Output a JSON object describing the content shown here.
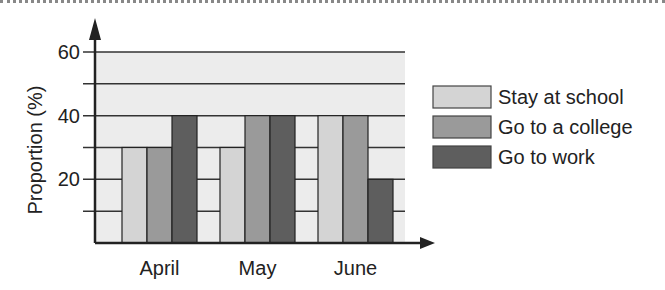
{
  "chart_data": {
    "type": "bar",
    "title": "",
    "xlabel": "",
    "ylabel": "Proportion (%)",
    "ylim": [
      0,
      60
    ],
    "yticks": [
      20,
      40,
      60
    ],
    "grid": true,
    "legend_position": "right",
    "categories": [
      "April",
      "May",
      "June"
    ],
    "series": [
      {
        "name": "Stay at school",
        "color": "#d4d4d4",
        "values": [
          30,
          30,
          40
        ]
      },
      {
        "name": "Go to a college",
        "color": "#9a9a9a",
        "values": [
          30,
          40,
          40
        ]
      },
      {
        "name": "Go to work",
        "color": "#5e5e5e",
        "values": [
          40,
          40,
          20
        ]
      }
    ]
  }
}
